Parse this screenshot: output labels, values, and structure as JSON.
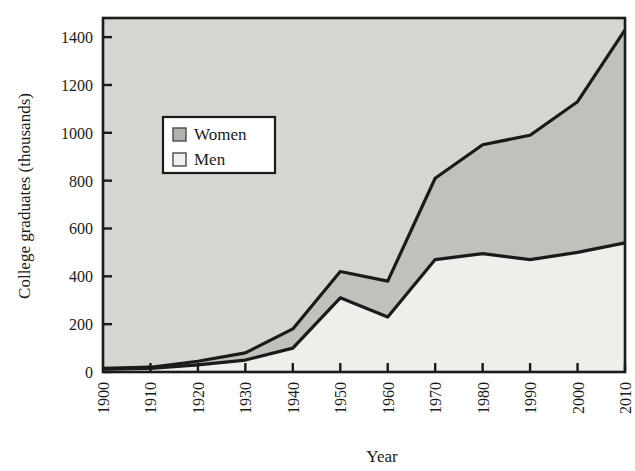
{
  "chart_data": {
    "type": "area",
    "title": "",
    "xlabel": "Year",
    "ylabel": "College graduates (thousands)",
    "x": [
      1900,
      1910,
      1920,
      1930,
      1940,
      1950,
      1960,
      1970,
      1980,
      1990,
      2000,
      2010
    ],
    "xlim": [
      1900,
      2010
    ],
    "ylim": [
      0,
      1480
    ],
    "ytick_labels": [
      "0",
      "200",
      "400",
      "600",
      "800",
      "1000",
      "1200",
      "1400"
    ],
    "ytick_values": [
      0,
      200,
      400,
      600,
      800,
      1000,
      1200,
      1400
    ],
    "xtick_labels": [
      "1900",
      "1910",
      "1920",
      "1930",
      "1940",
      "1950",
      "1960",
      "1970",
      "1980",
      "1990",
      "2000",
      "2010"
    ],
    "grid": false,
    "stacked": true,
    "legend_position": "upper-left-inside",
    "series": [
      {
        "name": "Men",
        "swatch_color": "#f2f0ec",
        "values": [
          12,
          15,
          30,
          50,
          100,
          310,
          230,
          470,
          495,
          470,
          500,
          540
        ]
      },
      {
        "name": "Women",
        "swatch_color": "#b3b1ac",
        "values": [
          3,
          5,
          15,
          30,
          80,
          110,
          150,
          340,
          455,
          520,
          630,
          890
        ]
      }
    ],
    "totals": [
      15,
      20,
      45,
      80,
      180,
      420,
      380,
      810,
      950,
      990,
      1130,
      1430
    ]
  },
  "legend": {
    "items": [
      {
        "label": "Women",
        "swatch": "#b3b1ac"
      },
      {
        "label": "Men",
        "swatch": "#f2f0ec"
      }
    ]
  },
  "colors": {
    "plot_background": "#d7d5d0",
    "men_fill": "#f0eeea",
    "women_fill": "#c2c0bb",
    "line": "#1a1a1a",
    "frame": "#1a1a1a",
    "page_background": "#ffffff"
  }
}
